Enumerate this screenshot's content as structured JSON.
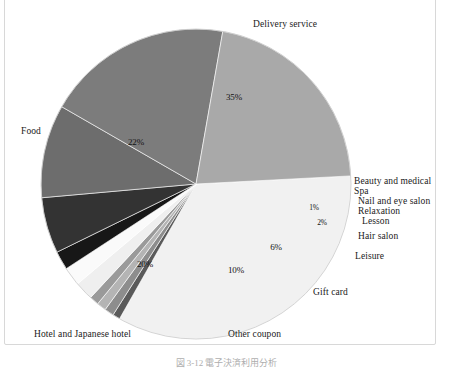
{
  "figure": {
    "caption": "図 3-12 電子決済利用分析",
    "background_color": "#ffffff",
    "frame_color": "#d8d8d8"
  },
  "chart_data": {
    "type": "pie",
    "title": "",
    "xlabel": "",
    "ylabel": "",
    "legend_position": "callout-labels",
    "grid": false,
    "start_angle_deg": -3,
    "direction": "clockwise",
    "categories": [
      "Delivery service",
      "Beauty and medical",
      "Spa",
      "Nail and eye salon",
      "Relaxation",
      "Lesson",
      "Hair salon",
      "Leisure",
      "Gift card",
      "Other coupon",
      "Hotel and Japanese hotel",
      "Food"
    ],
    "values": [
      35,
      0.8,
      1,
      1,
      1,
      2,
      2,
      2,
      6,
      10,
      20,
      22
    ],
    "value_labels": [
      "35%",
      "0.8%",
      "1%",
      "1%",
      "1%",
      "2%",
      "2%",
      "2%",
      "6%",
      "10%",
      "20%",
      "22%"
    ],
    "colors": [
      "#f1f1f1",
      "#5a5a5a",
      "#8d8d8d",
      "#b4b4b4",
      "#9a9a9a",
      "#efefef",
      "#fafafa",
      "#171717",
      "#333333",
      "#6d6d6d",
      "#7c7c7c",
      "#a9a9a9"
    ],
    "slice_label_positions": [
      {
        "label": "35%",
        "x": 234,
        "y": 97,
        "dark": false,
        "tiny": false
      },
      {
        "label": "0.8%",
        "x": 332,
        "y": 188,
        "dark": true,
        "tiny": true
      },
      {
        "label": "1%",
        "x": 345,
        "y": 195,
        "dark": true,
        "tiny": true
      },
      {
        "label": "1%",
        "x": 332,
        "y": 201,
        "dark": true,
        "tiny": true
      },
      {
        "label": "1%",
        "x": 314,
        "y": 207,
        "dark": false,
        "tiny": true
      },
      {
        "label": "2%",
        "x": 322,
        "y": 222,
        "dark": false,
        "tiny": true
      },
      {
        "label": "2%",
        "x": 311,
        "y": 235,
        "dark": true,
        "tiny": true
      },
      {
        "label": "6%",
        "x": 276,
        "y": 247,
        "dark": false,
        "tiny": false
      },
      {
        "label": "10%",
        "x": 236,
        "y": 270,
        "dark": false,
        "tiny": false
      },
      {
        "label": "20%",
        "x": 145,
        "y": 264,
        "dark": false,
        "tiny": false
      },
      {
        "label": "22%",
        "x": 136,
        "y": 142,
        "dark": false,
        "tiny": false
      }
    ],
    "callouts": [
      {
        "name": "Delivery service",
        "x": 253,
        "y": 19
      },
      {
        "name": "Beauty and medical",
        "x": 354,
        "y": 176
      },
      {
        "name": "Spa",
        "x": 354,
        "y": 186
      },
      {
        "name": "Nail and eye salon",
        "x": 358,
        "y": 196
      },
      {
        "name": "Relaxation",
        "x": 358,
        "y": 206
      },
      {
        "name": "Lesson",
        "x": 362,
        "y": 216
      },
      {
        "name": "Hair salon",
        "x": 358,
        "y": 231
      },
      {
        "name": "Leisure",
        "x": 355,
        "y": 251
      },
      {
        "name": "Gift card",
        "x": 313,
        "y": 287
      },
      {
        "name": "Other coupon",
        "x": 228,
        "y": 329
      },
      {
        "name": "Hotel and Japanese hotel",
        "x": 34,
        "y": 329
      },
      {
        "name": "Food",
        "x": 21,
        "y": 126
      }
    ]
  }
}
